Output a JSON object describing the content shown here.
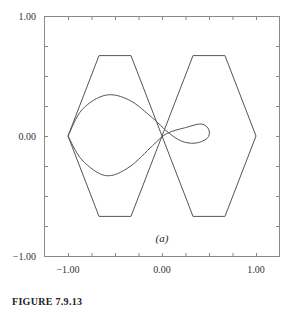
{
  "chart_data": {
    "type": "line",
    "title": "",
    "subtitle": "(a)",
    "xlabel": "",
    "ylabel": "",
    "xlim": [
      -1.0,
      1.0
    ],
    "ylim": [
      -1.0,
      1.0
    ],
    "grid": false,
    "legend": null,
    "x_ticks": [
      "-1.00",
      "0.00",
      "1.00"
    ],
    "y_ticks": [
      "-1.00",
      "0.00",
      "1.00"
    ],
    "series": [
      {
        "name": "left-hexagon",
        "points": [
          [
            -1.0,
            0.0
          ],
          [
            -0.67,
            0.67
          ],
          [
            -0.33,
            0.67
          ],
          [
            0.0,
            0.0
          ],
          [
            -0.33,
            -0.67
          ],
          [
            -0.67,
            -0.67
          ],
          [
            -1.0,
            0.0
          ]
        ]
      },
      {
        "name": "right-hexagon",
        "points": [
          [
            0.0,
            0.0
          ],
          [
            0.33,
            0.67
          ],
          [
            0.67,
            0.67
          ],
          [
            1.0,
            0.0
          ],
          [
            0.67,
            -0.67
          ],
          [
            0.33,
            -0.67
          ],
          [
            0.0,
            0.0
          ]
        ]
      },
      {
        "name": "figure-eight-curve",
        "points": [
          [
            -1.0,
            0.0
          ],
          [
            -0.85,
            0.22
          ],
          [
            -0.6,
            0.34
          ],
          [
            -0.35,
            0.3
          ],
          [
            -0.1,
            0.15
          ],
          [
            0.05,
            0.04
          ],
          [
            0.2,
            -0.04
          ],
          [
            0.35,
            -0.06
          ],
          [
            0.48,
            -0.02
          ],
          [
            0.5,
            0.05
          ],
          [
            0.42,
            0.1
          ],
          [
            0.25,
            0.07
          ],
          [
            0.05,
            0.02
          ],
          [
            -0.1,
            -0.08
          ],
          [
            -0.35,
            -0.26
          ],
          [
            -0.6,
            -0.33
          ],
          [
            -0.85,
            -0.2
          ],
          [
            -1.0,
            0.0
          ]
        ]
      }
    ]
  },
  "labels": {
    "subplot": "(a)",
    "figure": "FIGURE 7.9.13"
  }
}
